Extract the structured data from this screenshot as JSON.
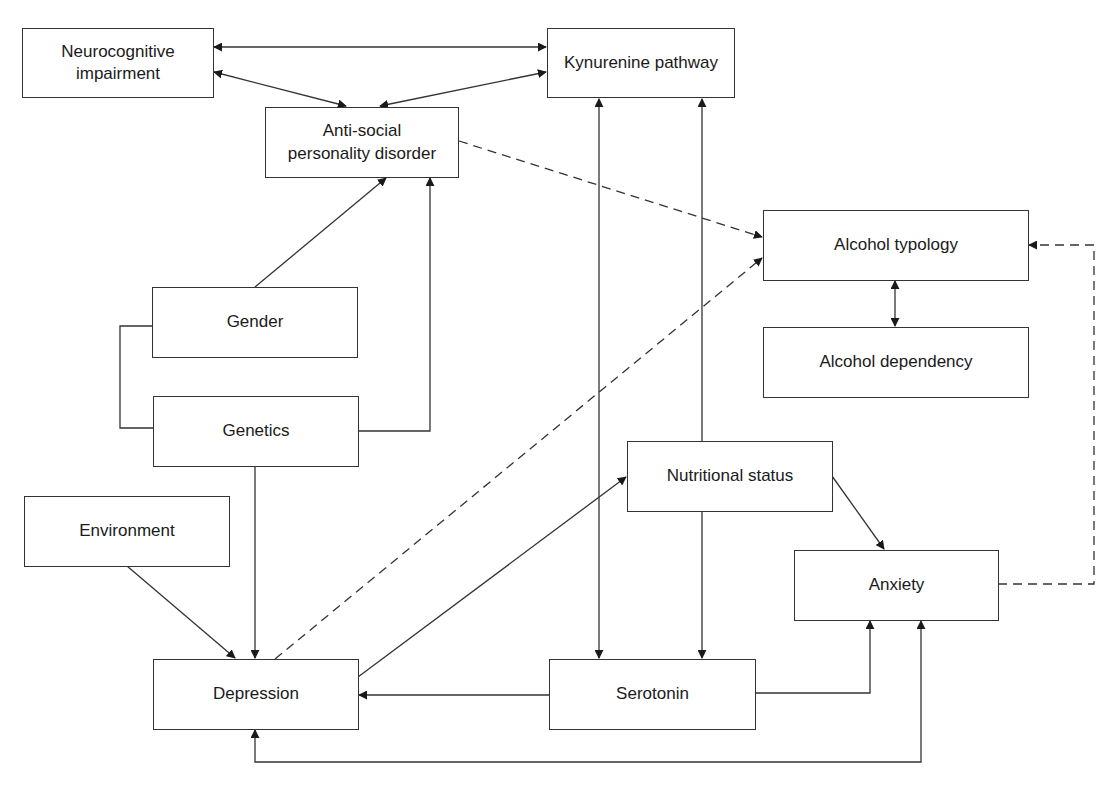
{
  "colors": {
    "stroke": "#333333",
    "text": "#1a1a1a",
    "background": "#ffffff"
  },
  "nodes": {
    "neurocognitive": {
      "label": "Neurocognitive\nimpairment",
      "x": 22,
      "y": 28,
      "w": 191,
      "h": 70
    },
    "kynurenine": {
      "label": "Kynurenine pathway",
      "x": 547,
      "y": 28,
      "w": 188,
      "h": 70
    },
    "aspd": {
      "label": "Anti-social\npersonality disorder",
      "x": 265,
      "y": 107,
      "w": 193,
      "h": 70
    },
    "alcohol_typology": {
      "label": "Alcohol typology",
      "x": 763,
      "y": 210,
      "w": 265,
      "h": 70
    },
    "alcohol_dependency": {
      "label": "Alcohol dependency",
      "x": 763,
      "y": 327,
      "w": 265,
      "h": 70
    },
    "gender": {
      "label": "Gender",
      "x": 152,
      "y": 287,
      "w": 206,
      "h": 70
    },
    "genetics": {
      "label": "Genetics",
      "x": 153,
      "y": 396,
      "w": 205,
      "h": 70
    },
    "nutritional": {
      "label": "Nutritional status",
      "x": 627,
      "y": 441,
      "w": 205,
      "h": 70
    },
    "environment": {
      "label": "Environment",
      "x": 24,
      "y": 496,
      "w": 205,
      "h": 70
    },
    "anxiety": {
      "label": "Anxiety",
      "x": 794,
      "y": 550,
      "w": 204,
      "h": 70
    },
    "depression": {
      "label": "Depression",
      "x": 153,
      "y": 659,
      "w": 205,
      "h": 70
    },
    "serotonin": {
      "label": "Serotonin",
      "x": 549,
      "y": 659,
      "w": 206,
      "h": 70
    }
  },
  "edges": [
    {
      "from": "neurocognitive",
      "to": "kynurenine",
      "style": "solid",
      "direction": "both"
    },
    {
      "from": "neurocognitive",
      "to": "aspd",
      "style": "solid",
      "direction": "both"
    },
    {
      "from": "kynurenine",
      "to": "aspd",
      "style": "solid",
      "direction": "both"
    },
    {
      "from": "aspd",
      "to": "alcohol_typology",
      "style": "dashed",
      "direction": "forward"
    },
    {
      "from": "gender",
      "to": "aspd",
      "style": "solid",
      "direction": "forward"
    },
    {
      "from": "genetics",
      "to": "aspd",
      "style": "solid",
      "direction": "forward"
    },
    {
      "from": "gender",
      "to": "genetics",
      "style": "solid",
      "direction": "none"
    },
    {
      "from": "genetics",
      "to": "depression",
      "style": "solid",
      "direction": "forward"
    },
    {
      "from": "environment",
      "to": "depression",
      "style": "solid",
      "direction": "forward"
    },
    {
      "from": "depression",
      "to": "alcohol_typology",
      "style": "dashed",
      "direction": "forward"
    },
    {
      "from": "depression",
      "to": "nutritional",
      "style": "solid",
      "direction": "forward"
    },
    {
      "from": "kynurenine",
      "to": "serotonin",
      "style": "solid",
      "direction": "both"
    },
    {
      "from": "nutritional",
      "to": "kynurenine",
      "style": "solid",
      "direction": "forward"
    },
    {
      "from": "nutritional",
      "to": "serotonin",
      "style": "solid",
      "direction": "forward"
    },
    {
      "from": "nutritional",
      "to": "anxiety",
      "style": "solid",
      "direction": "forward"
    },
    {
      "from": "alcohol_typology",
      "to": "alcohol_dependency",
      "style": "solid",
      "direction": "both"
    },
    {
      "from": "anxiety",
      "to": "alcohol_typology",
      "style": "dashed",
      "direction": "forward"
    },
    {
      "from": "serotonin",
      "to": "depression",
      "style": "solid",
      "direction": "forward"
    },
    {
      "from": "serotonin",
      "to": "anxiety",
      "style": "solid",
      "direction": "forward"
    },
    {
      "from": "anxiety",
      "to": "depression",
      "style": "solid",
      "direction": "both"
    }
  ]
}
